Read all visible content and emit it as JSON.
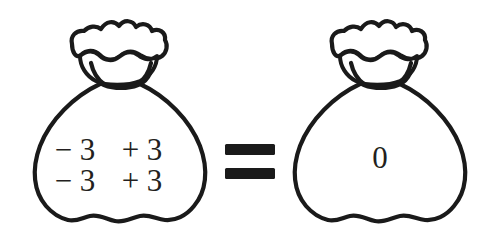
{
  "figure": {
    "title": "Zero pair money bags equation",
    "background_color": "#ffffff",
    "ink_color": "#1a1a1a",
    "text_color": "#231f20",
    "width": 502,
    "height": 251
  },
  "left_bag": {
    "name": "bag-with-zero-pairs",
    "rows": [
      {
        "minus_term": "− 3",
        "plus_term": "+ 3"
      },
      {
        "minus_term": "− 3",
        "plus_term": "+ 3"
      }
    ],
    "row1_left": "− 3",
    "row1_right": "+ 3",
    "row2_left": "− 3",
    "row2_right": "+ 3"
  },
  "operator": {
    "name": "equals-sign",
    "symbol": "="
  },
  "right_bag": {
    "name": "bag-with-zero",
    "value": "0"
  }
}
